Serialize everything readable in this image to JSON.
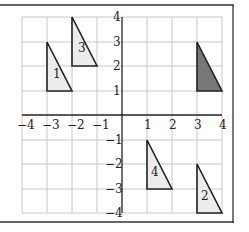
{
  "figure": {
    "title": "",
    "x_range": [
      -4,
      4
    ],
    "y_range": [
      -4,
      4
    ],
    "x_ticks": [
      "−4",
      "−3",
      "−2",
      "−1",
      "1",
      "2",
      "3",
      "4"
    ],
    "y_ticks": [
      "4",
      "3",
      "2",
      "1",
      "−1",
      "−2",
      "−3",
      "−4"
    ],
    "colors": {
      "grid": "#c8c8c8",
      "axis": "#222222",
      "light_fill": "#ececec",
      "dark_fill": "#777777"
    },
    "triangles": [
      {
        "label": "1",
        "vertices": [
          [
            -3,
            3
          ],
          [
            -3,
            1
          ],
          [
            -2,
            1
          ]
        ],
        "fill": "light"
      },
      {
        "label": "3",
        "vertices": [
          [
            -2,
            4
          ],
          [
            -2,
            2
          ],
          [
            -1,
            2
          ]
        ],
        "fill": "light"
      },
      {
        "label": "",
        "vertices": [
          [
            3,
            3
          ],
          [
            3,
            1
          ],
          [
            4,
            1
          ]
        ],
        "fill": "dark"
      },
      {
        "label": "4",
        "vertices": [
          [
            1,
            -1
          ],
          [
            1,
            -3
          ],
          [
            2,
            -3
          ]
        ],
        "fill": "light"
      },
      {
        "label": "2",
        "vertices": [
          [
            3,
            -2
          ],
          [
            3,
            -4
          ],
          [
            4,
            -4
          ]
        ],
        "fill": "light"
      }
    ]
  }
}
